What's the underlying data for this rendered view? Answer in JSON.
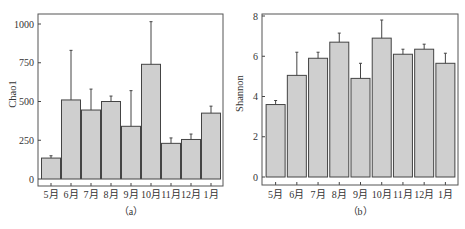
{
  "chart_data": [
    {
      "type": "bar",
      "title": "",
      "caption": "（a）",
      "xlabel": "",
      "ylabel": "Chao1",
      "ylim": [
        0,
        1000
      ],
      "yticks": [
        0,
        250,
        500,
        750,
        1000
      ],
      "grid": false,
      "legend": null,
      "categories": [
        "5月",
        "6月",
        "7月",
        "8月",
        "9月",
        "10月",
        "11月",
        "12月",
        "1月"
      ],
      "values": [
        135,
        510,
        445,
        500,
        340,
        740,
        230,
        255,
        425
      ],
      "error_upper": [
        150,
        830,
        580,
        535,
        570,
        1015,
        265,
        290,
        470
      ],
      "bar_color": "#cfcfcf",
      "edge_color": "#444444"
    },
    {
      "type": "bar",
      "title": "",
      "caption": "（b）",
      "xlabel": "",
      "ylabel": "Shannon",
      "ylim": [
        0,
        8
      ],
      "yticks": [
        0,
        2,
        4,
        6,
        8
      ],
      "grid": false,
      "legend": null,
      "categories": [
        "5月",
        "6月",
        "7月",
        "8月",
        "9月",
        "10月",
        "11月",
        "12月",
        "1月"
      ],
      "values": [
        3.6,
        5.05,
        5.9,
        6.7,
        4.9,
        6.9,
        6.1,
        6.35,
        5.65
      ],
      "error_upper": [
        3.8,
        6.2,
        6.2,
        7.15,
        5.65,
        7.8,
        6.35,
        6.6,
        6.15
      ],
      "bar_color": "#cfcfcf",
      "edge_color": "#444444"
    }
  ]
}
